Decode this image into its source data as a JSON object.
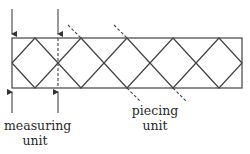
{
  "diagram": {
    "type": "quilt-border-diagram",
    "stroke_color": "#444444",
    "strip": {
      "x": 12,
      "y": 38,
      "width": 230,
      "height": 50
    },
    "diamond_count": 5,
    "labels": {
      "measuring_unit": {
        "line1": "measuring",
        "line2": "unit"
      },
      "piecing_unit": {
        "line1": "piecing",
        "line2": "unit"
      }
    }
  }
}
